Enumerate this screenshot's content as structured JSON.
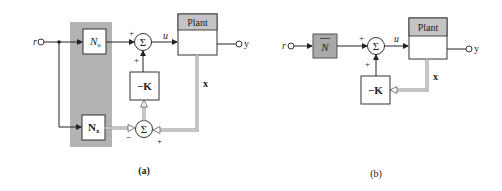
{
  "diagram_a": {
    "caption": "(a)",
    "input_label": "r",
    "output_label": "y",
    "control_label": "u",
    "state_label": "x",
    "plant_label": "Plant",
    "nu_label": "N",
    "nu_sub": "u",
    "nx_label": "N",
    "nx_sub": "x",
    "gain_label": "−K",
    "sum_symbol": "Σ",
    "sum1_signs": {
      "left": "+",
      "bottom": "+"
    },
    "sum2_signs": {
      "left": "−",
      "right": "+"
    }
  },
  "diagram_b": {
    "caption": "(b)",
    "input_label": "r",
    "output_label": "y",
    "control_label": "u",
    "state_label": "x",
    "plant_label": "Plant",
    "nbar_label": "N",
    "gain_label": "−K",
    "sum_symbol": "Σ",
    "sum_signs": {
      "left": "+",
      "bottom": "+"
    }
  }
}
